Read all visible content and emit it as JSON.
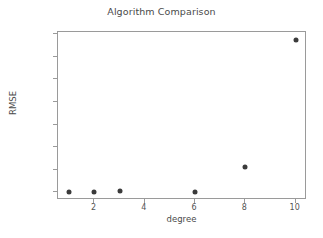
{
  "chart_data": {
    "type": "scatter",
    "title": "Algorithm Comparison",
    "xlabel": "degree",
    "ylabel": "RMSE",
    "x": [
      1,
      2,
      3,
      6,
      8,
      10
    ],
    "values": [
      2,
      3,
      12,
      4,
      285,
      1690
    ],
    "series": [
      {
        "name": "RMSE",
        "points": [
          {
            "x": 1,
            "y": 2
          },
          {
            "x": 2,
            "y": 3
          },
          {
            "x": 3,
            "y": 12
          },
          {
            "x": 6,
            "y": 4
          },
          {
            "x": 8,
            "y": 285
          },
          {
            "x": 10,
            "y": 1690
          }
        ]
      }
    ],
    "xlim": [
      0.55,
      10.45
    ],
    "ylim": [
      -85,
      1775
    ],
    "xticks": [
      2,
      4,
      6,
      8,
      10
    ],
    "xtick_labels": [
      "2",
      "4",
      "6",
      "8",
      "10"
    ],
    "yticks": [
      0,
      250,
      500,
      750,
      1000,
      1250,
      1500,
      1750
    ],
    "ytick_labels": [
      "0",
      "250",
      "500",
      "750",
      "1000",
      "1250",
      "1500",
      "1750"
    ],
    "grid": false,
    "legend": null,
    "marker_color": "#3b3b3b",
    "axes_color": "#9a9a9a",
    "background": "#ffffff"
  }
}
